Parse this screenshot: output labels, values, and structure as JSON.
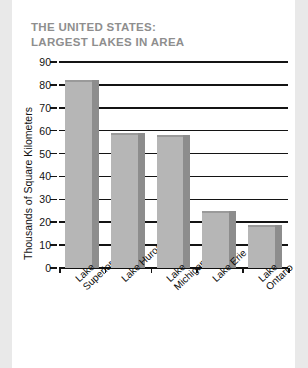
{
  "page": {
    "background_color": "#e9e9e9",
    "card_color": "#ffffff"
  },
  "title": {
    "text": "THE UNITED STATES:\nLARGEST LAKES IN AREA",
    "color": "#8e8e8e"
  },
  "chart_data": {
    "type": "bar",
    "title": "THE UNITED STATES: LARGEST LAKES IN AREA",
    "categories": [
      "Lake\nSuperior",
      "Lake Huron",
      "Lake\nMichigan",
      "Lake Erie",
      "Lake Ontario"
    ],
    "values": [
      82,
      59,
      58,
      25,
      19
    ],
    "xlabel": "",
    "ylabel": "Thousands of Square Kilometers",
    "ylim": [
      0,
      90
    ],
    "yticks": [
      0,
      10,
      20,
      30,
      40,
      50,
      60,
      70,
      80,
      90
    ],
    "ytick_labels": [
      "0",
      "10",
      "20",
      "30",
      "40",
      "50",
      "60",
      "70",
      "80",
      "90"
    ],
    "grid": true,
    "grid_axis": "y",
    "legend": "none",
    "bar_color": "#b6b6b6",
    "bar_shadow_color": "#8d8d8d",
    "axis_color": "#141414"
  }
}
